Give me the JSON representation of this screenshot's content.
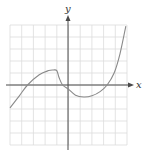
{
  "chart_data": {
    "type": "line",
    "title": "",
    "xlabel": "x",
    "ylabel": "y",
    "xlim": [
      -5,
      5
    ],
    "ylim": [
      -5,
      5
    ],
    "grid": true,
    "grid_step": 1,
    "legend": null,
    "series": [
      {
        "name": "f(x)",
        "x": [
          -5,
          -4.2,
          -3.5,
          -2.5,
          -1.7,
          -1.3,
          -1.0,
          -0.8,
          -0.5,
          0,
          0.6,
          1.3,
          2.0,
          2.7,
          3.3,
          3.9,
          4.4,
          4.9
        ],
        "y": [
          -1.9,
          -0.9,
          0,
          0.85,
          1.2,
          1.25,
          1.2,
          0.6,
          0,
          -0.35,
          -0.85,
          -1.0,
          -0.9,
          -0.55,
          0,
          1.0,
          2.6,
          4.9
        ]
      }
    ],
    "annotations": []
  },
  "labels": {
    "x_axis": "x",
    "y_axis": "y"
  },
  "colors": {
    "curve": "#8a8a8a",
    "axis": "#4a4a4a",
    "grid": "#dcdcdc"
  }
}
